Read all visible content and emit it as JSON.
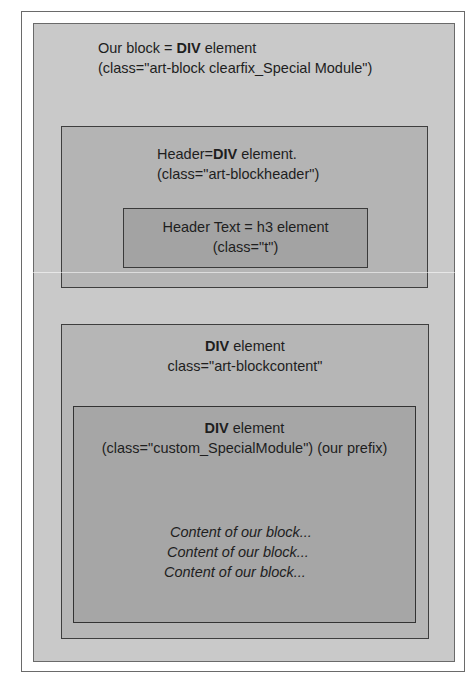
{
  "diagram": {
    "outer_block": {
      "line1_prefix": "Our block = ",
      "line1_bold": "DIV",
      "line1_suffix": " element",
      "line2": "(class=\"art-block clearfix_Special Module\")"
    },
    "header_div": {
      "line1_prefix": "Header=",
      "line1_bold": "DIV",
      "line1_suffix": " element.",
      "line2": "(class=\"art-blockheader\")"
    },
    "header_text": {
      "line1": "Header Text = h3 element",
      "line2": "(class=\"t\")"
    },
    "content_div": {
      "line1_bold": "DIV",
      "line1_suffix": " element",
      "line2": "class=\"art-blockcontent\""
    },
    "custom_div": {
      "line1_bold": "DIV",
      "line1_suffix": " element",
      "line2": "(class=\"custom_SpecialModule\") (our prefix)",
      "content_lines": [
        "Content of our block...",
        "Content of our block...",
        "Content of our block..."
      ]
    }
  },
  "colors": {
    "outer_block_fill": "#c9c9c9",
    "header_fill": "#b4b4b4",
    "h3_fill": "#a3a3a3",
    "content_fill": "#b6b6b6",
    "custom_fill": "#a6a6a6"
  }
}
